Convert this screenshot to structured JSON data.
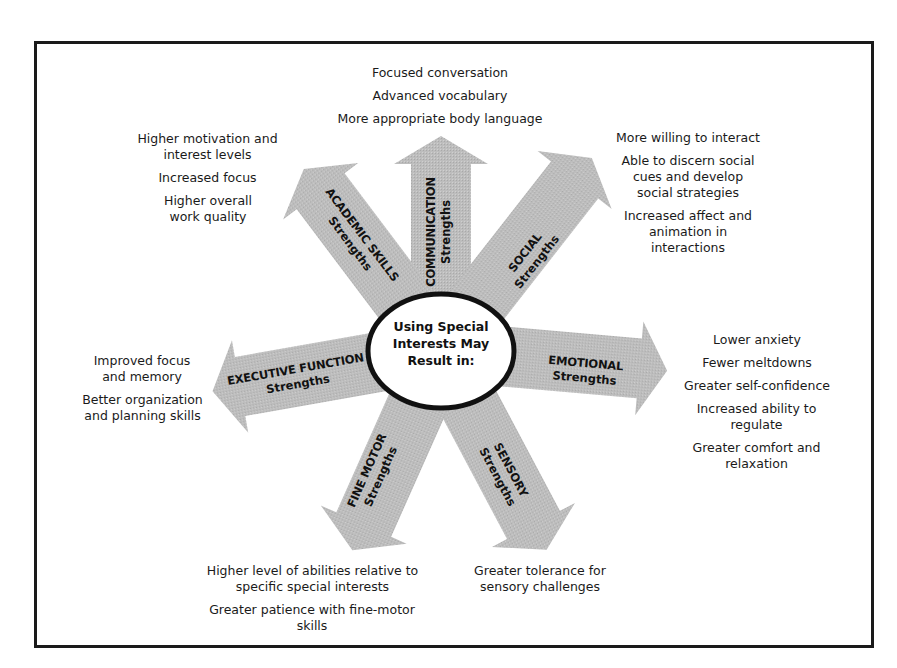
{
  "diagram": {
    "center": {
      "label_lines": [
        "Using Special",
        "Interests May",
        "Result in:"
      ]
    },
    "colors": {
      "arrow_fill": "#b9b9b9",
      "border": "#1a1a1a",
      "circle_fill": "#ffffff"
    },
    "arrows": [
      {
        "id": "communication",
        "title": "COMMUNICATION",
        "subtitle": "Strengths"
      },
      {
        "id": "social",
        "title": "SOCIAL",
        "subtitle": "Strengths"
      },
      {
        "id": "emotional",
        "title": "EMOTIONAL",
        "subtitle": "Strengths"
      },
      {
        "id": "sensory",
        "title": "SENSORY",
        "subtitle": "Strengths"
      },
      {
        "id": "fine_motor",
        "title": "FINE MOTOR",
        "subtitle": "Strengths"
      },
      {
        "id": "executive_function",
        "title": "EXECUTIVE FUNCTION",
        "subtitle": "Strengths"
      },
      {
        "id": "academic_skills",
        "title": "ACADEMIC SKILLS",
        "subtitle": "Strengths"
      }
    ],
    "outcomes": {
      "communication": [
        "Focused conversation",
        "Advanced vocabulary",
        "More appropriate body language"
      ],
      "social": [
        "More willing to interact",
        "Able to discern social cues and develop social strategies",
        "Increased affect and animation in interactions"
      ],
      "emotional": [
        "Lower anxiety",
        "Fewer meltdowns",
        "Greater self-confidence",
        "Increased ability to regulate",
        "Greater comfort and relaxation"
      ],
      "sensory": [
        "Greater tolerance for sensory challenges"
      ],
      "fine_motor": [
        "Higher level of abilities relative to specific special interests",
        "Greater patience with fine-motor skills"
      ],
      "executive_function": [
        "Improved focus and memory",
        "Better organization and planning skills"
      ],
      "academic_skills": [
        "Higher motivation and interest levels",
        "Increased focus",
        "Higher overall work quality"
      ]
    }
  }
}
